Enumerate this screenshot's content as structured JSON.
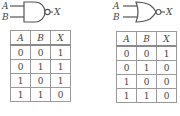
{
  "gates": [
    {
      "type": "NAND",
      "inputs": [
        "A",
        "B"
      ],
      "output": "X",
      "truth_table": {
        "headers": [
          "A",
          "B",
          "X"
        ],
        "rows": [
          [
            "0",
            "0",
            "1"
          ],
          [
            "0",
            "1",
            "1"
          ],
          [
            "1",
            "0",
            "1"
          ],
          [
            "1",
            "1",
            "0"
          ]
        ]
      }
    },
    {
      "type": "NOR",
      "inputs": [
        "A",
        "B"
      ],
      "output": "X",
      "truth_table": {
        "headers": [
          "A",
          "B",
          "X"
        ],
        "rows": [
          [
            "0",
            "0",
            "1"
          ],
          [
            "0",
            "1",
            "0"
          ],
          [
            "1",
            "0",
            "0"
          ],
          [
            "1",
            "1",
            "0"
          ]
        ]
      }
    }
  ]
}
